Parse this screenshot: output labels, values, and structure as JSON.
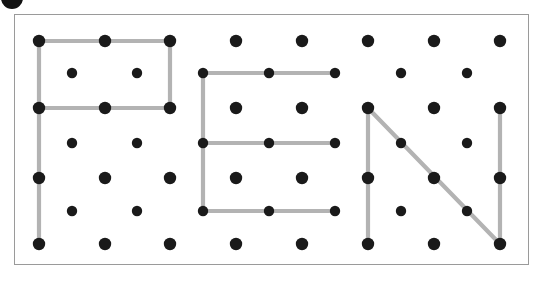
{
  "canvas": {
    "width": 539,
    "height": 282,
    "background": "#ffffff"
  },
  "frame": {
    "name": "geoboard-frame",
    "x": 14,
    "y": 14,
    "width": 515,
    "height": 251,
    "border_color": "#9a9a9a",
    "border_width": 1,
    "fill": "#ffffff"
  },
  "marker_badge": {
    "name": "corner-marker-dot",
    "cx": 12,
    "cy": -2,
    "r": 11,
    "color": "#121212"
  },
  "style": {
    "peg_color": "#1a1a1a",
    "peg_radius_major": 6.2,
    "peg_radius_minor": 5.2,
    "band_color": "#b3b3b3",
    "band_width": 4.2
  },
  "grid": {
    "description": "staggered peg lattice",
    "major_rows_y": [
      41,
      108,
      178,
      244
    ],
    "major_cols_x": [
      39,
      105,
      170,
      236,
      302,
      368,
      434,
      500
    ],
    "minor_rows_y": [
      73,
      143,
      211
    ],
    "minor_cols_x": [
      72,
      137,
      203,
      269,
      335,
      401,
      467
    ]
  },
  "letters": [
    {
      "name": "letter-p",
      "label": "P"
    },
    {
      "name": "letter-e",
      "label": "E"
    },
    {
      "name": "letter-n",
      "label": "N"
    }
  ],
  "bands": [
    {
      "name": "band-p-top",
      "letter": "P",
      "x1": 39,
      "y1": 41,
      "x2": 170,
      "y2": 41
    },
    {
      "name": "band-p-right",
      "letter": "P",
      "x1": 170,
      "y1": 41,
      "x2": 170,
      "y2": 108
    },
    {
      "name": "band-p-middle",
      "letter": "P",
      "x1": 39,
      "y1": 108,
      "x2": 170,
      "y2": 108
    },
    {
      "name": "band-p-stem",
      "letter": "P",
      "x1": 39,
      "y1": 41,
      "x2": 39,
      "y2": 244
    },
    {
      "name": "band-e-top",
      "letter": "E",
      "x1": 203,
      "y1": 73,
      "x2": 335,
      "y2": 73
    },
    {
      "name": "band-e-middle",
      "letter": "E",
      "x1": 203,
      "y1": 143,
      "x2": 335,
      "y2": 143
    },
    {
      "name": "band-e-bottom",
      "letter": "E",
      "x1": 203,
      "y1": 211,
      "x2": 335,
      "y2": 211
    },
    {
      "name": "band-e-spine",
      "letter": "E",
      "x1": 203,
      "y1": 73,
      "x2": 203,
      "y2": 211
    },
    {
      "name": "band-n-left-stem",
      "letter": "N",
      "x1": 368,
      "y1": 108,
      "x2": 368,
      "y2": 244
    },
    {
      "name": "band-n-diagonal",
      "letter": "N",
      "x1": 368,
      "y1": 108,
      "x2": 500,
      "y2": 244
    },
    {
      "name": "band-n-right-stem",
      "letter": "N",
      "x1": 500,
      "y1": 108,
      "x2": 500,
      "y2": 244
    }
  ],
  "pegs_major": [
    {
      "cx": 39,
      "cy": 41
    },
    {
      "cx": 105,
      "cy": 41
    },
    {
      "cx": 170,
      "cy": 41
    },
    {
      "cx": 236,
      "cy": 41
    },
    {
      "cx": 302,
      "cy": 41
    },
    {
      "cx": 368,
      "cy": 41
    },
    {
      "cx": 434,
      "cy": 41
    },
    {
      "cx": 500,
      "cy": 41
    },
    {
      "cx": 39,
      "cy": 108
    },
    {
      "cx": 105,
      "cy": 108
    },
    {
      "cx": 170,
      "cy": 108
    },
    {
      "cx": 236,
      "cy": 108
    },
    {
      "cx": 302,
      "cy": 108
    },
    {
      "cx": 368,
      "cy": 108
    },
    {
      "cx": 434,
      "cy": 108
    },
    {
      "cx": 500,
      "cy": 108
    },
    {
      "cx": 39,
      "cy": 178
    },
    {
      "cx": 105,
      "cy": 178
    },
    {
      "cx": 170,
      "cy": 178
    },
    {
      "cx": 236,
      "cy": 178
    },
    {
      "cx": 302,
      "cy": 178
    },
    {
      "cx": 368,
      "cy": 178
    },
    {
      "cx": 434,
      "cy": 178
    },
    {
      "cx": 500,
      "cy": 178
    },
    {
      "cx": 39,
      "cy": 244
    },
    {
      "cx": 105,
      "cy": 244
    },
    {
      "cx": 170,
      "cy": 244
    },
    {
      "cx": 236,
      "cy": 244
    },
    {
      "cx": 302,
      "cy": 244
    },
    {
      "cx": 368,
      "cy": 244
    },
    {
      "cx": 434,
      "cy": 244
    },
    {
      "cx": 500,
      "cy": 244
    }
  ],
  "pegs_minor": [
    {
      "cx": 72,
      "cy": 73
    },
    {
      "cx": 137,
      "cy": 73
    },
    {
      "cx": 203,
      "cy": 73
    },
    {
      "cx": 269,
      "cy": 73
    },
    {
      "cx": 335,
      "cy": 73
    },
    {
      "cx": 401,
      "cy": 73
    },
    {
      "cx": 467,
      "cy": 73
    },
    {
      "cx": 72,
      "cy": 143
    },
    {
      "cx": 137,
      "cy": 143
    },
    {
      "cx": 203,
      "cy": 143
    },
    {
      "cx": 269,
      "cy": 143
    },
    {
      "cx": 335,
      "cy": 143
    },
    {
      "cx": 401,
      "cy": 143
    },
    {
      "cx": 467,
      "cy": 143
    },
    {
      "cx": 72,
      "cy": 211
    },
    {
      "cx": 137,
      "cy": 211
    },
    {
      "cx": 203,
      "cy": 211
    },
    {
      "cx": 269,
      "cy": 211
    },
    {
      "cx": 335,
      "cy": 211
    },
    {
      "cx": 401,
      "cy": 211
    },
    {
      "cx": 467,
      "cy": 211
    }
  ]
}
